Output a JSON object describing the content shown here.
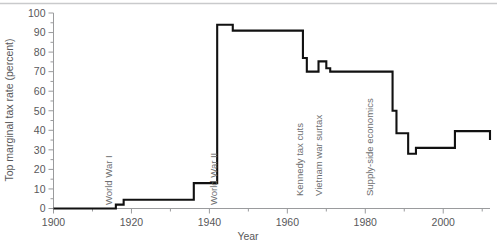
{
  "chart_data": {
    "type": "line",
    "title": "",
    "xlabel": "Year",
    "ylabel": "Top marginal tax rate (percent)",
    "xlim": [
      1900,
      2012
    ],
    "ylim": [
      0,
      100
    ],
    "grid": false,
    "legend": "none",
    "line_style": "step-post",
    "x_major_ticks": [
      1900,
      1920,
      1940,
      1960,
      1980,
      2000
    ],
    "x_minor_ticks": [
      1910,
      1930,
      1950,
      1970,
      1990,
      2010
    ],
    "y_major_ticks": [
      0,
      10,
      20,
      30,
      40,
      50,
      60,
      70,
      80,
      90,
      100
    ],
    "y_minor_ticks": [
      5,
      15,
      25,
      35,
      45,
      55,
      65,
      75,
      85,
      95
    ],
    "x_tick_labels": [
      "1900",
      "1920",
      "1940",
      "1960",
      "1980",
      "2000"
    ],
    "y_tick_labels": [
      "0",
      "10",
      "20",
      "30",
      "40",
      "50",
      "60",
      "70",
      "80",
      "90",
      "100"
    ],
    "series": [
      {
        "name": "Top marginal tax rate",
        "color": "#111111",
        "x": [
          1900,
          1913,
          1916,
          1917,
          1918,
          1919,
          1922,
          1924,
          1925,
          1932,
          1936,
          1941,
          1942,
          1944,
          1946,
          1948,
          1950,
          1952,
          1954,
          1964,
          1965,
          1968,
          1970,
          1971,
          1982,
          1987,
          1988,
          1991,
          1993,
          2003,
          2012
        ],
        "values": [
          0,
          0,
          2,
          2,
          4.5,
          4.5,
          4.5,
          4.5,
          4.5,
          4.5,
          13,
          13,
          94,
          94,
          91,
          91,
          91,
          91,
          91,
          77,
          70,
          75.25,
          71.75,
          70,
          70,
          50,
          38.5,
          28,
          31,
          39.6,
          35
        ],
        "values_note": "step-post: value holds until next x"
      }
    ],
    "annotations": [
      {
        "label": "World War I",
        "year": 1914,
        "rotation": -90
      },
      {
        "label": "World War II",
        "year": 1941,
        "rotation": -90
      },
      {
        "label": "Kennedy tax cuts",
        "year": 1963,
        "rotation": -90
      },
      {
        "label": "Vietnam war surtax",
        "year": 1968,
        "rotation": -90
      },
      {
        "label": "Supply-side economics",
        "year": 1981,
        "rotation": -90
      }
    ],
    "colors": {
      "data_line": "#111111",
      "axis": "#9a9b9d",
      "text": "#58585a",
      "annotation_text": "#6d6e70",
      "top_rule": "#c9cacc",
      "background": "#ffffff"
    }
  }
}
